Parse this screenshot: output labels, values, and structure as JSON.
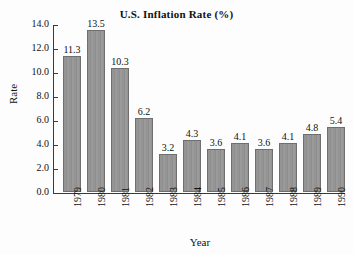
{
  "chart_data": {
    "type": "bar",
    "title": "U.S. Inflation Rate (%)",
    "xlabel": "Year",
    "ylabel": "Rate",
    "categories": [
      "1979",
      "1980",
      "1981",
      "1982",
      "1983",
      "1984",
      "1985",
      "1986",
      "1987",
      "1988",
      "1989",
      "1990"
    ],
    "values": [
      11.3,
      13.5,
      10.3,
      6.2,
      3.2,
      4.3,
      3.6,
      4.1,
      3.6,
      4.1,
      4.8,
      5.4
    ],
    "value_labels": [
      "11.3",
      "13.5",
      "10.3",
      "6.2",
      "3.2",
      "4.3",
      "3.6",
      "4.1",
      "3.6",
      "4.1",
      "4.8",
      "5.4"
    ],
    "ylim": [
      0.0,
      14.0
    ],
    "ytick_values": [
      0.0,
      2.0,
      4.0,
      6.0,
      8.0,
      10.0,
      12.0,
      14.0
    ],
    "ytick_labels": [
      "0.0",
      "2.0",
      "4.0",
      "6.0",
      "8.0",
      "10.0",
      "12.0",
      "14.0"
    ],
    "grid": false,
    "legend": false,
    "legend_position": "none",
    "bar_color": "#949494",
    "bar_edge_color": "#6f6f6f",
    "axis_color": "#3a3a3a",
    "background_color": "#fdfdfd",
    "text_color": "#111111"
  }
}
